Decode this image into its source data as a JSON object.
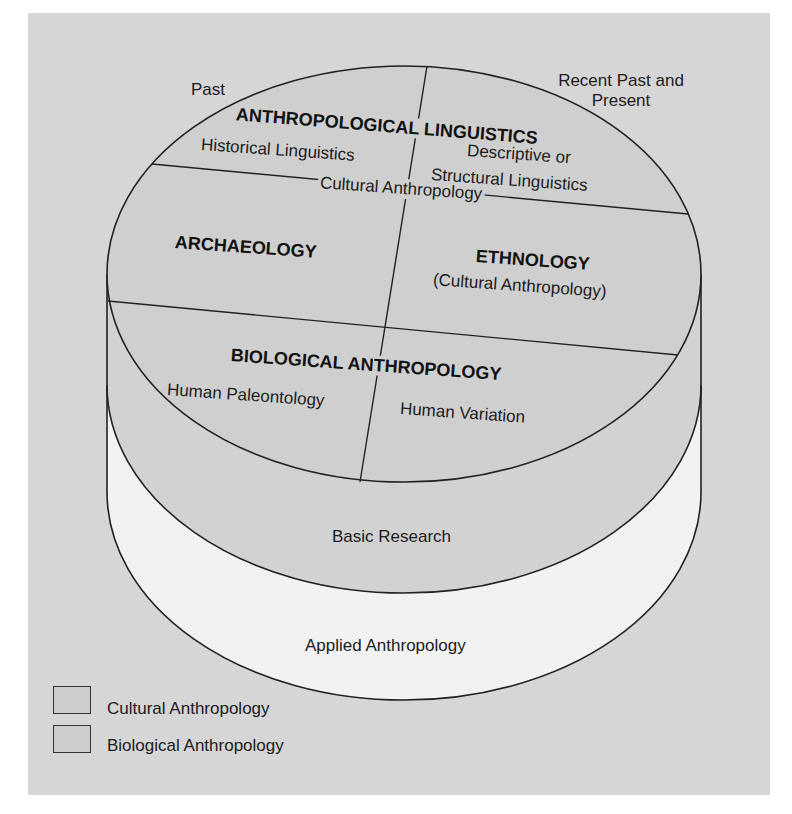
{
  "diagram": {
    "title_left": "Past",
    "title_right_line1": "Recent Past and",
    "title_right_line2": "Present",
    "top_disc": {
      "linguistics": {
        "heading": "ANTHROPOLOGICAL LINGUISTICS",
        "left_sub": "Historical Linguistics",
        "right_sub_line1": "Descriptive or",
        "right_sub_line2": "Structural Linguistics"
      },
      "divider_label": "Cultural Anthropology",
      "archaeology": "ARCHAEOLOGY",
      "ethnology": {
        "heading": "ETHNOLOGY",
        "sub": "(Cultural Anthropology)"
      },
      "biological": {
        "heading": "BIOLOGICAL ANTHROPOLOGY",
        "left_sub": "Human Paleontology",
        "right_sub": "Human Variation"
      }
    },
    "bands": {
      "basic": "Basic Research",
      "applied": "Applied Anthropology"
    },
    "legend": [
      {
        "label": "Cultural Anthropology",
        "color": "#cdcdcd"
      },
      {
        "label": "Biological Anthropology",
        "color": "#cdcdcd"
      }
    ],
    "colors": {
      "background": "#d6d6d6",
      "disc_fill": "#cfcfcf",
      "basic_band": "#d2d2d2",
      "applied_band": "#f2f2f2",
      "line": "#222222"
    }
  }
}
